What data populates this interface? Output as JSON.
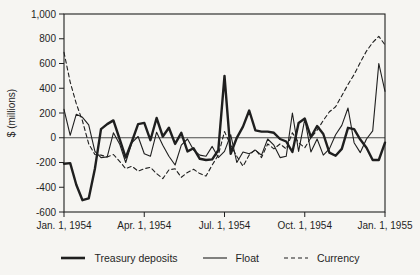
{
  "page": {
    "background": "#f6f5f2",
    "ink_color": "#1f1f1f"
  },
  "chart_data": {
    "type": "line",
    "title": "",
    "xlabel": "",
    "ylabel": "$ (millions)",
    "ylim": [
      -600,
      1000
    ],
    "ytick_interval": 200,
    "x_unit": "week",
    "x_range_weeks": [
      0,
      52
    ],
    "grid": false,
    "zero_line": true,
    "legend_position": "bottom",
    "yticks": [
      {
        "value": 1000,
        "label": "1,000"
      },
      {
        "value": 800,
        "label": "800"
      },
      {
        "value": 600,
        "label": "600"
      },
      {
        "value": 400,
        "label": "400"
      },
      {
        "value": 200,
        "label": "200"
      },
      {
        "value": 0,
        "label": "0"
      },
      {
        "value": -200,
        "label": "-200"
      },
      {
        "value": -400,
        "label": "-400"
      },
      {
        "value": -600,
        "label": "-600"
      }
    ],
    "xticks": [
      {
        "week": 0,
        "label": "Jan. 1, 1954"
      },
      {
        "week": 13,
        "label": "Apr. 1, 1954"
      },
      {
        "week": 26,
        "label": "Jul. 1, 1954"
      },
      {
        "week": 39,
        "label": "Oct. 1, 1954"
      },
      {
        "week": 52,
        "label": "Jan. 1, 1955"
      }
    ],
    "series": [
      {
        "name": "Treasury deposits",
        "line_style": "solid-thick",
        "values": [
          -210,
          -205,
          -380,
          -505,
          -490,
          -250,
          70,
          110,
          140,
          -10,
          -160,
          -30,
          110,
          120,
          -20,
          160,
          10,
          80,
          -50,
          40,
          -110,
          -85,
          -170,
          -180,
          -175,
          -100,
          500,
          -130,
          0,
          90,
          220,
          60,
          50,
          50,
          40,
          -10,
          -30,
          -115,
          120,
          155,
          5,
          95,
          30,
          -120,
          -145,
          -90,
          80,
          70,
          -15,
          -80,
          -180,
          -180,
          -40
        ]
      },
      {
        "name": "Float",
        "line_style": "solid-thin",
        "values": [
          230,
          20,
          190,
          165,
          105,
          -110,
          -160,
          -155,
          40,
          -50,
          -200,
          -40,
          10,
          -130,
          -150,
          45,
          -60,
          -150,
          -220,
          -60,
          -10,
          -100,
          -140,
          -150,
          -70,
          -160,
          -110,
          25,
          -200,
          -115,
          -130,
          -100,
          -140,
          -10,
          -60,
          -160,
          -150,
          200,
          -110,
          150,
          -115,
          -10,
          -140,
          -90,
          25,
          100,
          240,
          -40,
          -120,
          -10,
          55,
          600,
          375
        ]
      },
      {
        "name": "Currency",
        "line_style": "dashed",
        "values": [
          690,
          450,
          275,
          135,
          -50,
          -135,
          -140,
          -155,
          -135,
          -190,
          -250,
          -230,
          -270,
          -250,
          -240,
          -290,
          -330,
          -260,
          -250,
          -320,
          -280,
          -255,
          -290,
          -310,
          -220,
          -140,
          50,
          -60,
          -150,
          -230,
          -140,
          -95,
          -160,
          -50,
          -90,
          -50,
          -90,
          40,
          -40,
          -80,
          0,
          60,
          140,
          210,
          250,
          340,
          430,
          510,
          610,
          700,
          770,
          820,
          750
        ]
      }
    ]
  }
}
